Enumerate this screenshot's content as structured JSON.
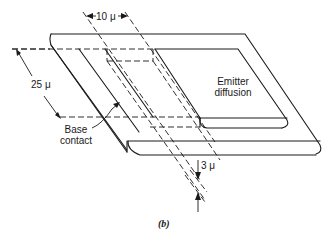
{
  "figure": {
    "caption": "(b)",
    "labels": {
      "width_dim": "10 μ",
      "length_dim": "25 μ",
      "depth_dim": "3 μ",
      "emitter_line1": "Emitter",
      "emitter_line2": "diffusion",
      "base_line1": "Base",
      "base_line2": "contact"
    },
    "colors": {
      "ink": "#1a1a1a",
      "background": "#ffffff"
    }
  }
}
